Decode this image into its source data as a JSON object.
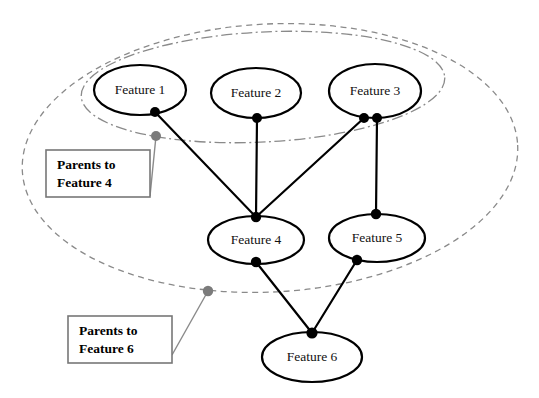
{
  "diagram": {
    "background_color": "#ffffff",
    "node_stroke_color": "#000000",
    "group_stroke_color": "#8a8a8a",
    "anchor_dot_color": "#7b7b7b"
  },
  "nodes": [
    {
      "id": "f1",
      "label": "Feature 1",
      "cx": 140,
      "cy": 90,
      "rx": 46,
      "ry": 25
    },
    {
      "id": "f2",
      "label": "Feature 2",
      "cx": 256,
      "cy": 93,
      "rx": 45,
      "ry": 25
    },
    {
      "id": "f3",
      "label": "Feature 3",
      "cx": 375,
      "cy": 91,
      "rx": 46,
      "ry": 27
    },
    {
      "id": "f4",
      "label": "Feature 4",
      "cx": 256,
      "cy": 240,
      "rx": 48,
      "ry": 24
    },
    {
      "id": "f5",
      "label": "Feature 5",
      "cx": 377,
      "cy": 238,
      "rx": 48,
      "ry": 24
    },
    {
      "id": "f6",
      "label": "Feature 6",
      "cx": 312,
      "cy": 357,
      "rx": 50,
      "ry": 25
    }
  ],
  "edges": [
    {
      "from": "f1",
      "to": "f4",
      "x1": 155,
      "y1": 112,
      "x2": 256,
      "y2": 217
    },
    {
      "from": "f2",
      "to": "f4",
      "x1": 257,
      "y1": 118,
      "x2": 256,
      "y2": 217
    },
    {
      "from": "f3",
      "to": "f4",
      "x1": 364,
      "y1": 118,
      "x2": 256,
      "y2": 217
    },
    {
      "from": "f3",
      "to": "f5",
      "x1": 377,
      "y1": 118,
      "x2": 376,
      "y2": 214
    },
    {
      "from": "f4",
      "to": "f6",
      "x1": 256,
      "y1": 262,
      "x2": 312,
      "y2": 333
    },
    {
      "from": "f5",
      "to": "f6",
      "x1": 357,
      "y1": 260,
      "x2": 312,
      "y2": 333
    }
  ],
  "port_dots": [
    {
      "owner": "f1",
      "cx": 155,
      "cy": 112,
      "r": 5.0
    },
    {
      "owner": "f2",
      "cx": 257,
      "cy": 118,
      "r": 5.0
    },
    {
      "owner": "f3",
      "cx": 364,
      "cy": 118,
      "r": 5.0
    },
    {
      "owner": "f3",
      "cx": 377,
      "cy": 118,
      "r": 5.0
    },
    {
      "owner": "f4",
      "cx": 256,
      "cy": 217,
      "r": 5.2
    },
    {
      "owner": "f4",
      "cx": 256,
      "cy": 262,
      "r": 5.2
    },
    {
      "owner": "f5",
      "cx": 376,
      "cy": 214,
      "r": 5.2
    },
    {
      "owner": "f5",
      "cx": 357,
      "cy": 260,
      "r": 5.2
    },
    {
      "owner": "f6",
      "cx": 312,
      "cy": 333,
      "r": 5.6
    }
  ],
  "groups": [
    {
      "id": "parents-of-feature-4",
      "style": "dash-dot",
      "cx": 263,
      "cy": 87,
      "rx": 182,
      "ry": 55,
      "rotate": -3
    },
    {
      "id": "parents-of-feature-6",
      "style": "dashed",
      "cx": 270,
      "cy": 158,
      "rx": 248,
      "ry": 134,
      "rotate": -3
    }
  ],
  "anchors": [
    {
      "for": "parents-of-feature-4",
      "cx": 156,
      "cy": 136,
      "r": 5.0
    },
    {
      "for": "parents-of-feature-6",
      "cx": 208,
      "cy": 291,
      "r": 5.2
    }
  ],
  "leaders": [
    {
      "for": "parents-of-feature-4",
      "x1": 156,
      "y1": 136,
      "x2": 150,
      "y2": 196
    },
    {
      "for": "parents-of-feature-6",
      "x1": 208,
      "y1": 291,
      "x2": 172,
      "y2": 355
    }
  ],
  "callouts": [
    {
      "id": "callout-feature-4",
      "line1": "Parents to",
      "line2": "Feature 4",
      "x": 46,
      "y": 150,
      "width": 104,
      "height": 47
    },
    {
      "id": "callout-feature-6",
      "line1": "Parents to",
      "line2": "Feature 6",
      "x": 68,
      "y": 316,
      "width": 104,
      "height": 47
    }
  ]
}
